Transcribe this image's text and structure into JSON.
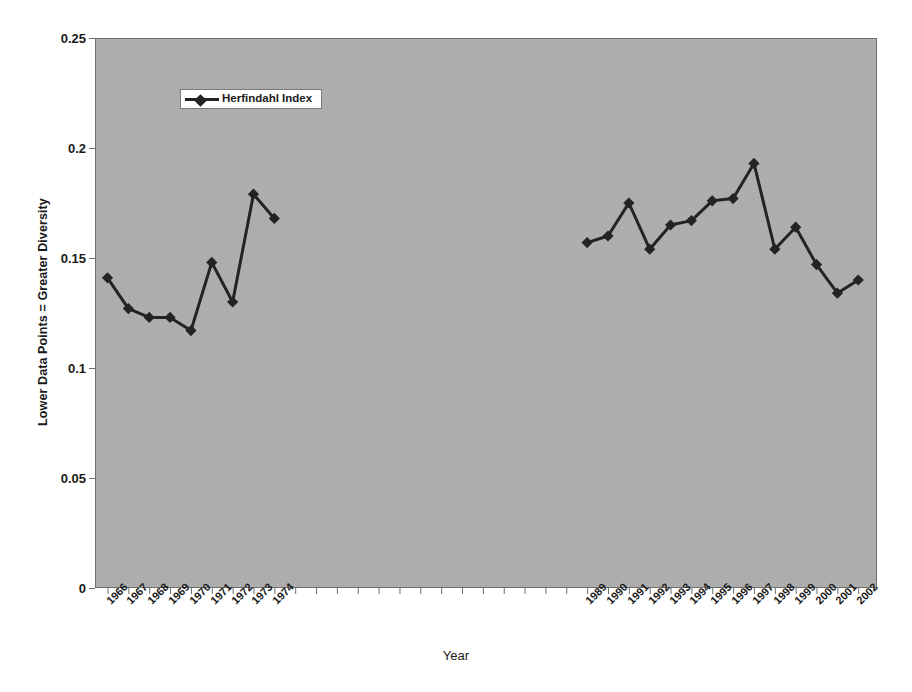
{
  "chart_data": {
    "type": "line",
    "title": "",
    "subtitle": "",
    "xlabel": "Year",
    "ylabel": "Lower Data Points = Greater Diversity",
    "legend": [
      "Herfindahl Index"
    ],
    "legend_position": "top-left-inside",
    "grid": false,
    "ylim": [
      0,
      0.25
    ],
    "ytick_labels": [
      "0",
      "0.05",
      "0.1",
      "0.15",
      "0.2",
      "0.25"
    ],
    "ytick_values": [
      0,
      0.05,
      0.1,
      0.15,
      0.2,
      0.25
    ],
    "categories": [
      "1966",
      "1967",
      "1968",
      "1969",
      "1970",
      "1971",
      "1972",
      "1973",
      "1974",
      "1989",
      "1990",
      "1991",
      "1992",
      "1993",
      "1994",
      "1995",
      "1996",
      "1997",
      "1998",
      "1999",
      "2000",
      "2001",
      "2002"
    ],
    "series": [
      {
        "name": "Herfindahl Index",
        "values": [
          0.141,
          0.127,
          0.123,
          0.123,
          0.117,
          0.148,
          0.13,
          0.179,
          0.168,
          0.157,
          0.16,
          0.175,
          0.154,
          0.165,
          0.167,
          0.176,
          0.177,
          0.193,
          0.154,
          0.164,
          0.147,
          0.134,
          0.14
        ],
        "gap_after_category": "1974",
        "color": "#232323",
        "marker": "diamond"
      }
    ],
    "plot_background": "#b0b0b0",
    "figure_background": "#ffffff",
    "axis_color": "#6a6a6a"
  },
  "axes": {
    "y_axis_name": "Lower Data Points = Greater Diversity",
    "x_axis_name": "Year"
  }
}
